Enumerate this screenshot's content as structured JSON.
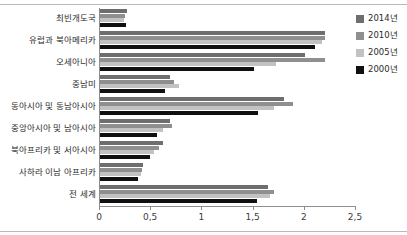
{
  "chart_data": {
    "type": "bar",
    "orientation": "horizontal",
    "title": "",
    "subtitle": "",
    "xlabel": "",
    "ylabel": "",
    "xlim": [
      0,
      2.5
    ],
    "xticks": [
      "0",
      "0,5",
      "1",
      "1,5",
      "2",
      "2,5"
    ],
    "xtick_values": [
      0,
      0.5,
      1,
      1.5,
      2,
      2.5
    ],
    "grid": false,
    "legend_position": "top-right",
    "decimal_separator": ",",
    "categories": [
      "최빈개도국",
      "유럽과 북아메리카",
      "오세아니아",
      "중남미",
      "동아시아 및 동남아시아",
      "중앙아시아 및 남아시아",
      "북아프리카 및 서아시아",
      "사하라 이남 아프리카",
      "전 세계"
    ],
    "series": [
      {
        "name": "2014년",
        "color": "#6e6e6e",
        "values": [
          0.26,
          2.2,
          2.0,
          0.68,
          1.8,
          0.68,
          0.62,
          0.42,
          1.64
        ]
      },
      {
        "name": "2010년",
        "color": "#8f8f8f",
        "values": [
          0.24,
          2.2,
          2.2,
          0.72,
          1.88,
          0.7,
          0.58,
          0.41,
          1.7
        ]
      },
      {
        "name": "2005년",
        "color": "#c2c2c2",
        "values": [
          0.23,
          2.17,
          1.72,
          0.77,
          1.7,
          0.62,
          0.53,
          0.4,
          1.66
        ]
      },
      {
        "name": "2000년",
        "color": "#101010",
        "values": [
          0.25,
          2.1,
          1.5,
          0.63,
          1.54,
          0.56,
          0.49,
          0.37,
          1.53
        ]
      }
    ]
  },
  "legend": {
    "items": [
      {
        "label": "2014년",
        "color": "#6e6e6e"
      },
      {
        "label": "2010년",
        "color": "#8f8f8f"
      },
      {
        "label": "2005년",
        "color": "#c2c2c2"
      },
      {
        "label": "2000년",
        "color": "#101010"
      }
    ]
  }
}
